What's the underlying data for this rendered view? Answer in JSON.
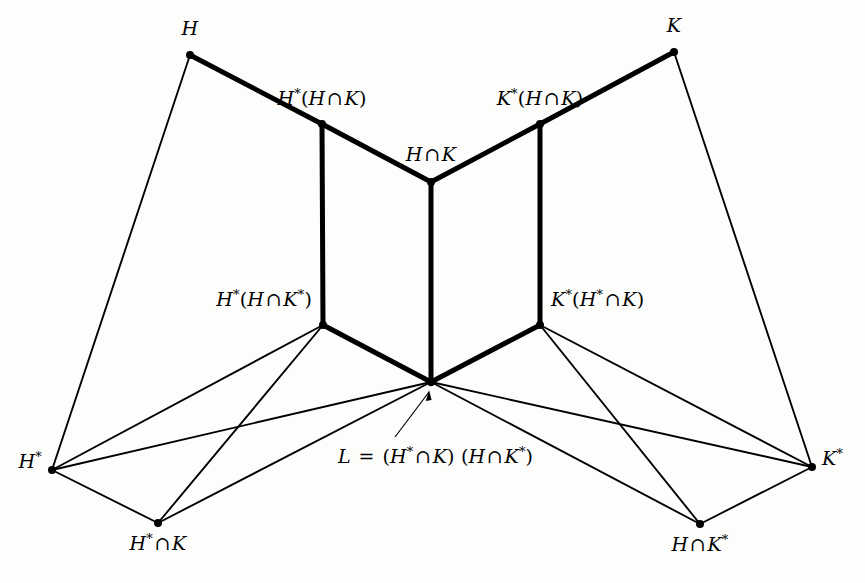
{
  "figure": {
    "type": "lattice-diagram",
    "background_color": "#fdfdfc",
    "line_color": "#000000",
    "node_color": "#000000"
  },
  "nodes": [
    {
      "id": "H",
      "label_parts": [
        {
          "t": "H",
          "s": "i"
        }
      ],
      "x": 190,
      "y": 55,
      "label_x": 190,
      "label_y": 19,
      "anchor": "c"
    },
    {
      "id": "K",
      "label_parts": [
        {
          "t": "K",
          "s": "i"
        }
      ],
      "x": 674,
      "y": 52,
      "label_x": 674,
      "label_y": 16,
      "anchor": "c"
    },
    {
      "id": "Hs_HiK",
      "label_parts": [
        {
          "t": "H",
          "s": "i"
        },
        {
          "t": "*",
          "s": "u"
        },
        {
          "t": "(",
          "s": "p"
        },
        {
          "t": "H",
          "s": "i"
        },
        {
          "t": "∩",
          "s": "o"
        },
        {
          "t": "K",
          "s": "i"
        },
        {
          "t": ")",
          "s": "p"
        }
      ],
      "x": 322,
      "y": 124,
      "label_x": 322,
      "label_y": 89,
      "anchor": "c"
    },
    {
      "id": "Ks_HiK",
      "label_parts": [
        {
          "t": "K",
          "s": "i"
        },
        {
          "t": "*",
          "s": "u"
        },
        {
          "t": "(",
          "s": "p"
        },
        {
          "t": "H",
          "s": "i"
        },
        {
          "t": "∩",
          "s": "o"
        },
        {
          "t": "K",
          "s": "i"
        },
        {
          "t": ")",
          "s": "p"
        }
      ],
      "x": 540,
      "y": 124,
      "label_x": 540,
      "label_y": 89,
      "anchor": "c"
    },
    {
      "id": "HiK",
      "label_parts": [
        {
          "t": "H",
          "s": "i"
        },
        {
          "t": "∩",
          "s": "o"
        },
        {
          "t": "K",
          "s": "i"
        }
      ],
      "x": 431,
      "y": 182,
      "label_x": 431,
      "label_y": 145,
      "anchor": "c"
    },
    {
      "id": "Hs_HiKs",
      "label_parts": [
        {
          "t": "H",
          "s": "i"
        },
        {
          "t": "*",
          "s": "u"
        },
        {
          "t": "(",
          "s": "p"
        },
        {
          "t": "H",
          "s": "i"
        },
        {
          "t": "∩",
          "s": "o"
        },
        {
          "t": "K",
          "s": "i"
        },
        {
          "t": "*",
          "s": "u"
        },
        {
          "t": ")",
          "s": "p"
        }
      ],
      "x": 323,
      "y": 325,
      "label_x": 312,
      "label_y": 290,
      "anchor": "r"
    },
    {
      "id": "Ks_HsiK",
      "label_parts": [
        {
          "t": "K",
          "s": "i"
        },
        {
          "t": "*",
          "s": "u"
        },
        {
          "t": "(",
          "s": "p"
        },
        {
          "t": "H",
          "s": "i"
        },
        {
          "t": "*",
          "s": "u"
        },
        {
          "t": "∩",
          "s": "o"
        },
        {
          "t": "K",
          "s": "i"
        },
        {
          "t": ")",
          "s": "p"
        }
      ],
      "x": 540,
      "y": 325,
      "label_x": 551,
      "label_y": 290,
      "anchor": "l"
    },
    {
      "id": "L",
      "label_parts": [],
      "x": 431,
      "y": 382,
      "label_x": 431,
      "label_y": 382,
      "anchor": "c"
    },
    {
      "id": "Hs",
      "label_parts": [
        {
          "t": "H",
          "s": "i"
        },
        {
          "t": "*",
          "s": "u"
        }
      ],
      "x": 52,
      "y": 470,
      "label_x": 42,
      "label_y": 452,
      "anchor": "r"
    },
    {
      "id": "Ks",
      "label_parts": [
        {
          "t": "K",
          "s": "i"
        },
        {
          "t": "*",
          "s": "u"
        }
      ],
      "x": 812,
      "y": 467,
      "label_x": 822,
      "label_y": 449,
      "anchor": "l"
    },
    {
      "id": "HsiK",
      "label_parts": [
        {
          "t": "H",
          "s": "i"
        },
        {
          "t": "*",
          "s": "u"
        },
        {
          "t": "∩",
          "s": "o"
        },
        {
          "t": "K",
          "s": "i"
        }
      ],
      "x": 158,
      "y": 523,
      "label_x": 158,
      "label_y": 534,
      "anchor": "c"
    },
    {
      "id": "HiKs",
      "label_parts": [
        {
          "t": "H",
          "s": "i"
        },
        {
          "t": "∩",
          "s": "o"
        },
        {
          "t": "K",
          "s": "i"
        },
        {
          "t": "*",
          "s": "u"
        }
      ],
      "x": 700,
      "y": 524,
      "label_x": 700,
      "label_y": 535,
      "anchor": "c"
    }
  ],
  "annotation": {
    "id": "L-definition",
    "label_parts": [
      {
        "t": "L",
        "s": "i"
      },
      {
        "t": "=",
        "s": "eq"
      },
      {
        "t": "(",
        "s": "p"
      },
      {
        "t": "H",
        "s": "i"
      },
      {
        "t": "*",
        "s": "u"
      },
      {
        "t": "∩",
        "s": "o"
      },
      {
        "t": "K",
        "s": "i"
      },
      {
        "t": ")",
        "s": "p"
      },
      {
        "t": " ",
        "s": "p"
      },
      {
        "t": "(",
        "s": "p"
      },
      {
        "t": "H",
        "s": "i"
      },
      {
        "t": "∩",
        "s": "o"
      },
      {
        "t": "K",
        "s": "i"
      },
      {
        "t": "*",
        "s": "u"
      },
      {
        "t": ")",
        "s": "p"
      }
    ],
    "label_x": 338,
    "label_y": 447,
    "arrow_from_x": 395,
    "arrow_from_y": 437,
    "arrow_to_x": 429,
    "arrow_to_y": 392
  },
  "edges_thin": [
    {
      "from": "H",
      "to": "Hs"
    },
    {
      "from": "K",
      "to": "Ks"
    },
    {
      "from": "Hs",
      "to": "HsiK"
    },
    {
      "from": "Ks",
      "to": "HiKs"
    },
    {
      "from": "Hs",
      "to": "Hs_HiKs"
    },
    {
      "from": "Ks",
      "to": "Ks_HsiK"
    },
    {
      "from": "HsiK",
      "to": "Hs_HiKs"
    },
    {
      "from": "HiKs",
      "to": "Ks_HsiK"
    },
    {
      "from": "Hs",
      "to": "L"
    },
    {
      "from": "Ks",
      "to": "L"
    },
    {
      "from": "HsiK",
      "to": "L"
    },
    {
      "from": "HiKs",
      "to": "L"
    }
  ],
  "edges_thick": [
    {
      "from": "H",
      "to": "Hs_HiK"
    },
    {
      "from": "K",
      "to": "Ks_HiK"
    },
    {
      "from": "Hs_HiK",
      "to": "HiK"
    },
    {
      "from": "Ks_HiK",
      "to": "HiK"
    },
    {
      "from": "Hs_HiK",
      "to": "Hs_HiKs"
    },
    {
      "from": "Ks_HiK",
      "to": "Ks_HsiK"
    },
    {
      "from": "HiK",
      "to": "L"
    },
    {
      "from": "Hs_HiKs",
      "to": "L"
    },
    {
      "from": "Ks_HsiK",
      "to": "L"
    }
  ]
}
